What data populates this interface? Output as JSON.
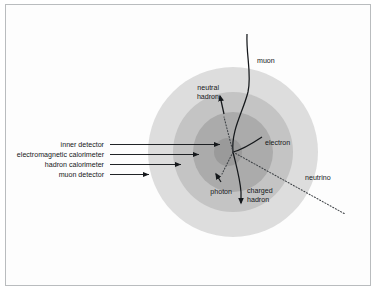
{
  "figure": {
    "background_color": "#ffffff",
    "border_color": "#b9bcbe"
  },
  "detector_layers": [
    {
      "id": "inner-detector",
      "label": "inner detector",
      "color": "#9a9a9a",
      "radius": 16,
      "order": 1
    },
    {
      "id": "electromagnetic-calorimeter",
      "label": "electromagnetic calorimeter",
      "color": "#a9a9a9",
      "radius": 40,
      "order": 2
    },
    {
      "id": "hadron-calorimeter",
      "label": "hadron calorimeter",
      "color": "#c3c3c3",
      "radius": 60,
      "order": 3
    },
    {
      "id": "muon-detector",
      "label": "muon detector",
      "color": "#dcdcdc",
      "radius": 85,
      "order": 4
    }
  ],
  "center": {
    "label": "interaction vertex",
    "x": 233,
    "y": 152
  },
  "particles": [
    {
      "id": "muon",
      "label": "muon",
      "line_style": "solid",
      "label_x": 257,
      "label_y": 63
    },
    {
      "id": "neutral-hadron",
      "label_line1": "neutral",
      "label_line2": "hadron",
      "line_style": "dotted-then-solid",
      "label_x": 219,
      "label_y": 92
    },
    {
      "id": "electron",
      "label": "electron",
      "line_style": "solid",
      "label_x": 265,
      "label_y": 144
    },
    {
      "id": "photon",
      "label": "photon",
      "line_style": "solid-arrow",
      "label_x": 220,
      "label_y": 192
    },
    {
      "id": "charged-hadron",
      "label_line1": "charged",
      "label_line2": "hadron",
      "line_style": "solid",
      "label_x": 256,
      "label_y": 194
    },
    {
      "id": "neutrino",
      "label": "neutrino",
      "line_style": "dotted",
      "label_x": 310,
      "label_y": 179
    }
  ],
  "callouts": [
    {
      "id": "inner-detector",
      "label": "inner detector",
      "text_x": 105,
      "text_y": 145,
      "arrow_x1": 110,
      "arrow_x2": 222
    },
    {
      "id": "electromagnetic-calorimeter",
      "label": "electromagnetic calorimeter",
      "text_x": 105,
      "text_y": 155,
      "arrow_x1": 110,
      "arrow_x2": 200
    },
    {
      "id": "hadron-calorimeter",
      "label": "hadron calorimeter",
      "text_x": 105,
      "text_y": 165,
      "arrow_x1": 110,
      "arrow_x2": 183
    },
    {
      "id": "muon-detector",
      "label": "muon detector",
      "text_x": 105,
      "text_y": 175,
      "arrow_x1": 110,
      "arrow_x2": 150
    }
  ]
}
